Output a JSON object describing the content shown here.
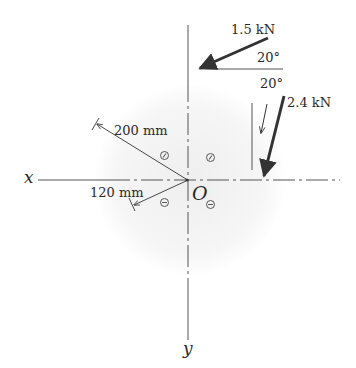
{
  "diagram": {
    "type": "free-body diagram",
    "axes": {
      "x_label": "x",
      "y_label": "y",
      "origin_label": "O"
    },
    "forces": [
      {
        "magnitude_label": "1.5 kN",
        "angle_label": "20°",
        "angle_reference": "horizontal"
      },
      {
        "magnitude_label": "2.4 kN",
        "angle_label": "20°",
        "angle_reference": "vertical"
      }
    ],
    "dimensions": [
      {
        "label": "200 mm"
      },
      {
        "label": "120 mm"
      }
    ],
    "holes": [
      {
        "quadrant": "upper-left"
      },
      {
        "quadrant": "upper-right"
      },
      {
        "quadrant": "lower-left"
      },
      {
        "quadrant": "lower-right"
      }
    ],
    "colors": {
      "line": "#333333",
      "axis": "#555555",
      "text": "#2a2a2a",
      "background": "#ffffff"
    }
  }
}
